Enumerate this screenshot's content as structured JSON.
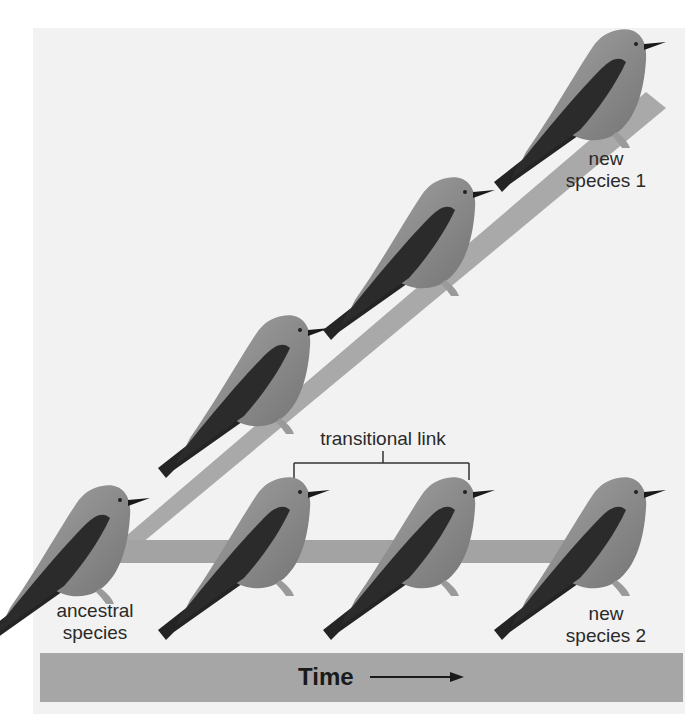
{
  "figure": {
    "colors": {
      "background": "#ffffff",
      "panel": "#f2f2f2",
      "lineage_bar": "#a9a9a9",
      "time_bar": "#a6a6a6",
      "bird_body": "#8c8c8c",
      "bird_wing": "#2b2b2b",
      "text": "#2a2a2a"
    }
  },
  "labels": {
    "ancestral": {
      "line1": "ancestral",
      "line2": "species"
    },
    "new_species_1": {
      "line1": "new",
      "line2": "species 1"
    },
    "new_species_2": {
      "line1": "new",
      "line2": "species 2"
    },
    "transitional_link": "transitional link"
  },
  "time_axis": {
    "label": "Time",
    "arrow": "right-arrow"
  },
  "lineages": [
    {
      "name": "diagonal-lineage",
      "leads_to": "new species 1"
    },
    {
      "name": "horizontal-lineage",
      "leads_to": "new species 2"
    }
  ],
  "birds": [
    {
      "id": "ancestral",
      "lineage": "root",
      "x": 70,
      "y": 480
    },
    {
      "id": "diag-1",
      "lineage": "diagonal",
      "x": 250,
      "y": 312
    },
    {
      "id": "diag-2",
      "lineage": "diagonal",
      "x": 415,
      "y": 173
    },
    {
      "id": "diag-3-new-species-1",
      "lineage": "diagonal",
      "x": 590,
      "y": 27
    },
    {
      "id": "horiz-1-transitional",
      "lineage": "horizontal",
      "x": 250,
      "y": 477
    },
    {
      "id": "horiz-2-transitional",
      "lineage": "horizontal",
      "x": 415,
      "y": 477
    },
    {
      "id": "horiz-3-new-species-2",
      "lineage": "horizontal",
      "x": 590,
      "y": 477
    }
  ]
}
